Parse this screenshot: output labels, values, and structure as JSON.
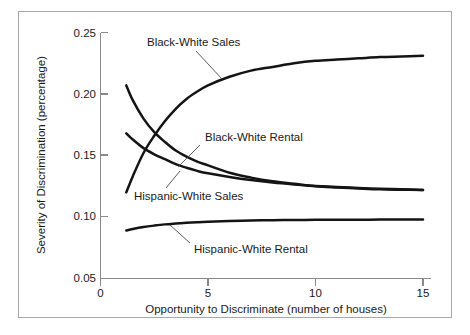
{
  "chart_data": {
    "type": "line",
    "title": "",
    "xlabel": "Opportunity to Discriminate (number of houses)",
    "ylabel": "Severity of Discrimination (percentage)",
    "xlim": [
      0,
      15.6
    ],
    "ylim": [
      0.05,
      0.255
    ],
    "xticks": [
      0,
      5,
      10,
      15
    ],
    "xticklabels": [
      "0",
      "5",
      "10",
      "15"
    ],
    "yticks": [
      0.05,
      0.1,
      0.15,
      0.2,
      0.25
    ],
    "yticklabels": [
      "0.05",
      "0.10",
      "0.15",
      "0.20",
      "0.25"
    ],
    "grid": false,
    "legend": "inline-annotations",
    "x": [
      1.2,
      1.5,
      2,
      2.5,
      3,
      3.5,
      4,
      4.5,
      5,
      6,
      7,
      8,
      9,
      10,
      11,
      12,
      13,
      14,
      15
    ],
    "series": [
      {
        "name": "Black-White Sales",
        "values": [
          0.12,
          0.133,
          0.152,
          0.166,
          0.178,
          0.188,
          0.196,
          0.202,
          0.207,
          0.214,
          0.219,
          0.222,
          0.225,
          0.227,
          0.228,
          0.229,
          0.23,
          0.2305,
          0.231
        ]
      },
      {
        "name": "Black-White Rental",
        "values": [
          0.207,
          0.195,
          0.18,
          0.169,
          0.161,
          0.154,
          0.149,
          0.145,
          0.142,
          0.136,
          0.132,
          0.129,
          0.127,
          0.125,
          0.124,
          0.1232,
          0.1225,
          0.1222,
          0.122
        ]
      },
      {
        "name": "Hispanic-White Sales",
        "values": [
          0.168,
          0.163,
          0.156,
          0.151,
          0.147,
          0.143,
          0.14,
          0.1375,
          0.1355,
          0.1325,
          0.13,
          0.128,
          0.1265,
          0.1253,
          0.1244,
          0.1236,
          0.123,
          0.1225,
          0.122
        ]
      },
      {
        "name": "Hispanic-White Rental",
        "values": [
          0.089,
          0.0902,
          0.0918,
          0.093,
          0.094,
          0.0947,
          0.0953,
          0.0958,
          0.0962,
          0.0968,
          0.0972,
          0.0974,
          0.0976,
          0.0977,
          0.0978,
          0.0978,
          0.0979,
          0.0979,
          0.098
        ]
      }
    ],
    "annotations": [
      {
        "text": "Black-White Sales",
        "series": "Black-White Sales"
      },
      {
        "text": "Black-White Rental",
        "series": "Black-White Rental"
      },
      {
        "text": "Hispanic-White Sales",
        "series": "Hispanic-White Sales"
      },
      {
        "text": "Hispanic-White Rental",
        "series": "Hispanic-White Rental"
      }
    ]
  },
  "axes": {
    "x_title": "Opportunity to Discriminate (number of houses)",
    "y_title": "Severity of Discrimination (percentage)",
    "x_tick_0": "0",
    "x_tick_1": "5",
    "x_tick_2": "10",
    "x_tick_3": "15",
    "y_tick_0": "0.05",
    "y_tick_1": "0.10",
    "y_tick_2": "0.15",
    "y_tick_3": "0.20",
    "y_tick_4": "0.25"
  },
  "labels": {
    "black_white_sales": "Black-White Sales",
    "black_white_rental": "Black-White Rental",
    "hispanic_white_sales": "Hispanic-White Sales",
    "hispanic_white_rental": "Hispanic-White Rental"
  },
  "colors": {
    "curve": "#141414",
    "axis": "#8a8a8a",
    "frame": "#a8a8a8",
    "text": "#1a1a1a",
    "background": "#ffffff"
  }
}
